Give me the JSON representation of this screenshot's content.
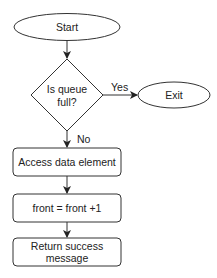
{
  "diagram": {
    "type": "flowchart",
    "nodes": {
      "start": {
        "label": "Start",
        "shape": "ellipse"
      },
      "decision": {
        "label_line1": "Is queue",
        "label_line2": "full?",
        "shape": "diamond"
      },
      "exit": {
        "label": "Exit",
        "shape": "ellipse"
      },
      "access": {
        "label": "Access data element",
        "shape": "rounded-rect"
      },
      "increment": {
        "label": "front = front +1",
        "shape": "rounded-rect"
      },
      "return": {
        "label_line1": "Return success",
        "label_line2": "message",
        "shape": "rounded-rect"
      }
    },
    "edges": {
      "yes_label": "Yes",
      "no_label": "No"
    },
    "colors": {
      "stroke": "#333333",
      "fill": "#ffffff",
      "text": "#222222"
    }
  }
}
